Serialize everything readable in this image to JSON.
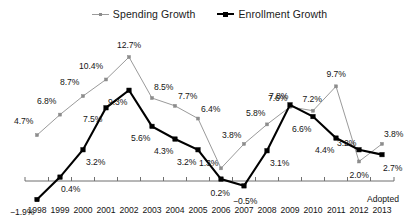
{
  "legend": {
    "position": "top-center",
    "entries": [
      {
        "label": "Spending Growth",
        "key": "spending",
        "color": "#8c8c8c",
        "marker": "small-square"
      },
      {
        "label": "Enrollment Growth",
        "key": "enrollment",
        "color": "#000000",
        "marker": "filled-square"
      }
    ]
  },
  "axis": {
    "adopted_note": "Adopted",
    "baseline_value": 0
  },
  "chart_data": {
    "type": "line",
    "title": "",
    "subtitle": "",
    "xlabel": "",
    "ylabel": "",
    "grid": false,
    "legend_position": "top-center",
    "ylim": [
      -2.5,
      13.5
    ],
    "categories": [
      "1998",
      "1999",
      "2000",
      "2001",
      "2002",
      "2003",
      "2004",
      "2005",
      "2006",
      "2007",
      "2008",
      "2009",
      "2010",
      "2011",
      "2012",
      "2013"
    ],
    "tick_labels": [
      "1998",
      "1999",
      "2000",
      "2001",
      "2002",
      "2003",
      "2004",
      "2005",
      "2006",
      "2007",
      "2008",
      "2009",
      "2010",
      "2011",
      "2012",
      "2013"
    ],
    "annotations": [
      "Adopted"
    ],
    "series": [
      {
        "name": "Spending Growth",
        "color": "#8c8c8c",
        "values": [
          4.7,
          6.8,
          8.7,
          10.4,
          12.7,
          8.5,
          7.7,
          6.4,
          1.3,
          3.8,
          5.8,
          7.6,
          7.2,
          9.7,
          2.0,
          3.8
        ],
        "data_labels": [
          "4.7%",
          "6.8%",
          "8.7%",
          "10.4%",
          "12.7%",
          "8.5%",
          "7.7%",
          "6.4%",
          "1.3%",
          "3.8%",
          "5.8%",
          "7.6%",
          "7.2%",
          "9.7%",
          "2.0%",
          "3.8%"
        ]
      },
      {
        "name": "Enrollment Growth",
        "color": "#000000",
        "values": [
          -1.9,
          0.4,
          3.2,
          7.5,
          9.3,
          5.6,
          4.3,
          3.2,
          0.2,
          -0.5,
          3.1,
          7.8,
          6.6,
          4.4,
          3.2,
          2.7
        ],
        "data_labels": [
          "−1.9%",
          "0.4%",
          "3.2%",
          "7.5%",
          "9.3%",
          "5.6%",
          "4.3%",
          "3.2%",
          "0.2%",
          "−0.5%",
          "3.1%",
          "7.8%",
          "6.6%",
          "4.4%",
          "3.2%",
          "2.7%"
        ]
      }
    ]
  }
}
